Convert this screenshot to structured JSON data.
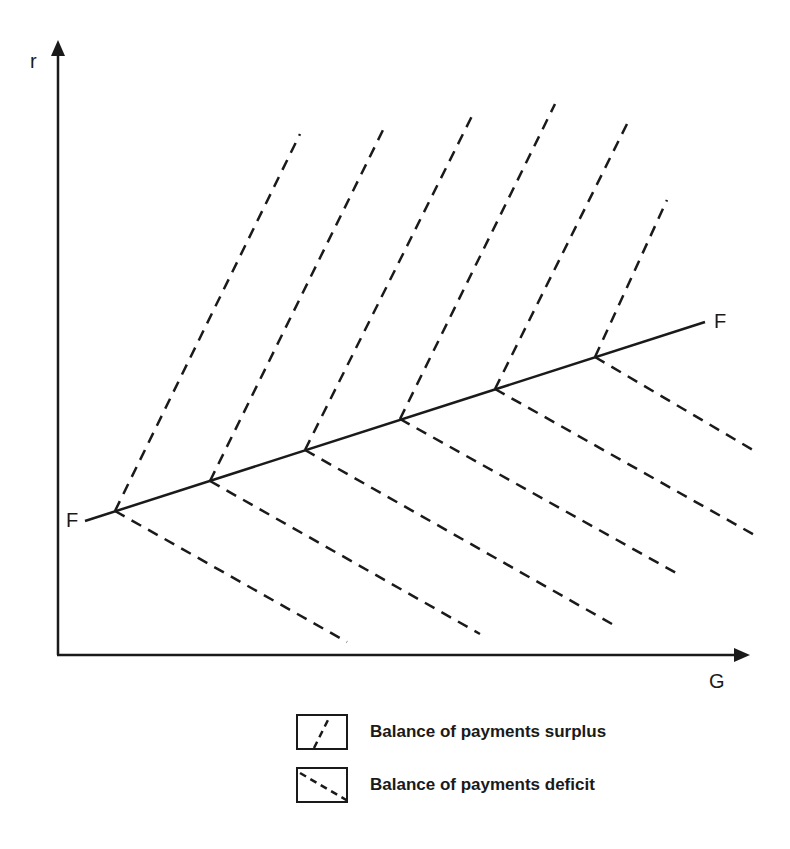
{
  "chart_data": {
    "type": "diagram",
    "title": "",
    "xlabel": "G",
    "ylabel": "r",
    "curve": {
      "name": "FF",
      "label_left": "F",
      "label_right": "F",
      "start": [
        85,
        521
      ],
      "end": [
        705,
        322
      ]
    },
    "surplus_lines": [
      {
        "from": [
          115,
          511
        ],
        "to": [
          300,
          134
        ]
      },
      {
        "from": [
          210,
          481
        ],
        "to": [
          385,
          126
        ]
      },
      {
        "from": [
          305,
          450
        ],
        "to": [
          473,
          114
        ]
      },
      {
        "from": [
          400,
          419
        ],
        "to": [
          555,
          104
        ]
      },
      {
        "from": [
          495,
          389
        ],
        "to": [
          628,
          122
        ]
      },
      {
        "from": [
          595,
          357
        ],
        "to": [
          667,
          200
        ]
      }
    ],
    "deficit_lines": [
      {
        "from": [
          115,
          511
        ],
        "to": [
          347,
          642
        ]
      },
      {
        "from": [
          210,
          481
        ],
        "to": [
          480,
          634
        ]
      },
      {
        "from": [
          305,
          450
        ],
        "to": [
          612,
          624
        ]
      },
      {
        "from": [
          400,
          419
        ],
        "to": [
          678,
          574
        ]
      },
      {
        "from": [
          495,
          389
        ],
        "to": [
          758,
          537
        ]
      },
      {
        "from": [
          595,
          357
        ],
        "to": [
          758,
          453
        ]
      }
    ],
    "legend": [
      {
        "style": "dashed-up",
        "label": "Balance of payments surplus"
      },
      {
        "style": "dashed-down",
        "label": "Balance of payments deficit"
      }
    ]
  },
  "axes": {
    "y_label": "r",
    "x_label": "G"
  },
  "curve_labels": {
    "left": "F",
    "right": "F"
  },
  "legend": {
    "surplus_label": "Balance of payments surplus",
    "deficit_label": "Balance of payments deficit"
  },
  "colors": {
    "ink": "#1a1a1a",
    "background": "#ffffff"
  }
}
